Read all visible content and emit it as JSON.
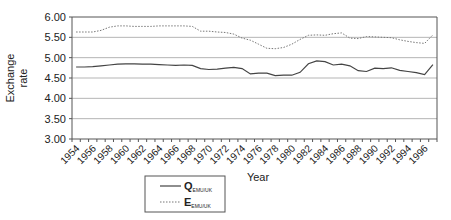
{
  "chart_data": {
    "type": "line",
    "title": "",
    "xlabel": "Year",
    "ylabel_lines": [
      "Exchange",
      "rate"
    ],
    "ylim": [
      3.0,
      6.0
    ],
    "yticks": [
      "3.00",
      "3.50",
      "4.00",
      "4.50",
      "5.00",
      "5.50",
      "6.00"
    ],
    "ytick_values": [
      3.0,
      3.5,
      4.0,
      4.5,
      5.0,
      5.5,
      6.0
    ],
    "grid": true,
    "legend_position": "bottom-left",
    "x": [
      1954,
      1955,
      1956,
      1957,
      1958,
      1959,
      1960,
      1961,
      1962,
      1963,
      1964,
      1965,
      1966,
      1967,
      1968,
      1969,
      1970,
      1971,
      1972,
      1973,
      1974,
      1975,
      1976,
      1977,
      1978,
      1979,
      1980,
      1981,
      1982,
      1983,
      1984,
      1985,
      1986,
      1987,
      1988,
      1989,
      1990,
      1991,
      1992,
      1993,
      1994,
      1995,
      1996,
      1997
    ],
    "xtick_labels": [
      "1954",
      "1956",
      "1958",
      "1960",
      "1962",
      "1964",
      "1966",
      "1968",
      "1970",
      "1972",
      "1974",
      "1976",
      "1978",
      "1980",
      "1982",
      "1984",
      "1986",
      "1988",
      "1990",
      "1992",
      "1994",
      "1996"
    ],
    "series": [
      {
        "name": "Q",
        "subscript": "EMU/UK",
        "style": "solid",
        "color": "#444444",
        "values": [
          4.77,
          4.77,
          4.78,
          4.8,
          4.82,
          4.84,
          4.85,
          4.85,
          4.84,
          4.84,
          4.83,
          4.82,
          4.81,
          4.82,
          4.81,
          4.73,
          4.71,
          4.72,
          4.74,
          4.76,
          4.73,
          4.6,
          4.62,
          4.62,
          4.56,
          4.57,
          4.57,
          4.64,
          4.85,
          4.92,
          4.9,
          4.82,
          4.84,
          4.8,
          4.68,
          4.66,
          4.74,
          4.73,
          4.75,
          4.69,
          4.66,
          4.63,
          4.58,
          4.83
        ]
      },
      {
        "name": "E",
        "subscript": "EMU/UK",
        "style": "dotted",
        "color": "#777777",
        "values": [
          5.63,
          5.63,
          5.63,
          5.67,
          5.75,
          5.78,
          5.78,
          5.77,
          5.77,
          5.77,
          5.78,
          5.78,
          5.78,
          5.78,
          5.77,
          5.65,
          5.65,
          5.63,
          5.62,
          5.58,
          5.48,
          5.43,
          5.33,
          5.23,
          5.22,
          5.25,
          5.33,
          5.45,
          5.55,
          5.56,
          5.55,
          5.59,
          5.61,
          5.48,
          5.47,
          5.52,
          5.51,
          5.5,
          5.49,
          5.44,
          5.4,
          5.37,
          5.35,
          5.56
        ]
      }
    ]
  }
}
